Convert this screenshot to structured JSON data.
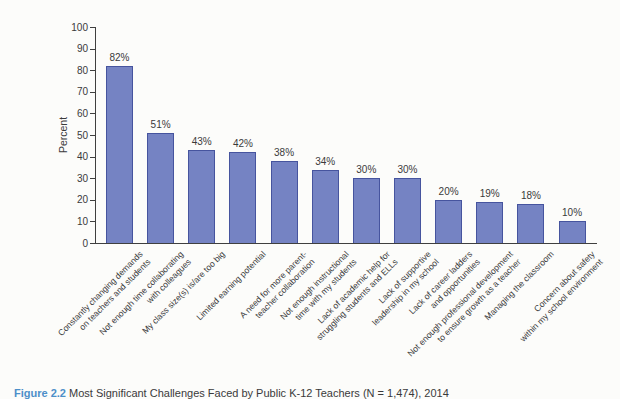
{
  "figure": {
    "caption_prefix": "Figure 2.2",
    "caption_text": " Most Significant Challenges Faced by Public K-12 Teachers (N = 1,474), 2014"
  },
  "chart_data": {
    "type": "bar",
    "title": "",
    "xlabel": "",
    "ylabel": "Percent",
    "ylim": [
      0,
      100
    ],
    "ytick_step": 10,
    "grid": false,
    "legend": "none",
    "categories": [
      "Constantly changing demands\non teachers and students",
      "Not enough time collaborating\nwith colleagues",
      "My class size(s) is/are too big",
      "Limited earning potential",
      "A need for more parent-\nteacher collaboration",
      "Not enough instructional\ntime with my students",
      "Lack of academic help for\nstruggling students and ELLs",
      "Lack of supportive\nleadership in my school",
      "Lack of career ladders\nand opportunities",
      "Not enough professional development\nto ensure growth as a teacher",
      "Managing the classroom",
      "Concern about safety\nwithin my school environment"
    ],
    "values": [
      82,
      51,
      43,
      42,
      38,
      34,
      30,
      30,
      20,
      19,
      18,
      10
    ],
    "value_labels": [
      "82%",
      "51%",
      "43%",
      "42%",
      "38%",
      "34%",
      "30%",
      "30%",
      "20%",
      "19%",
      "18%",
      "10%"
    ],
    "colors": {
      "bar_fill": "#7583c3",
      "bar_border": "#46549e",
      "axis": "#3f3f3f",
      "text": "#3a3a3a",
      "caption_accent": "#4c8fc9"
    }
  }
}
